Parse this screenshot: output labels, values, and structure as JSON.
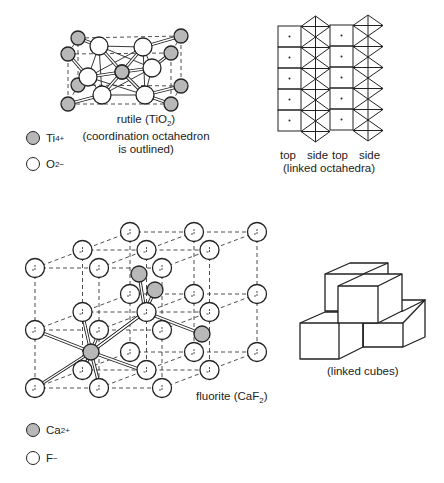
{
  "colors": {
    "cation": "#b8b8b8",
    "anion": "#ffffff",
    "stroke": "#222222"
  },
  "rutile": {
    "name": "rutile",
    "formula_base": "TiO",
    "formula_sub": "2",
    "caption_line2": "(coordination octahedron",
    "caption_line3": "is outlined)",
    "legend": [
      {
        "symbol": "Ti",
        "charge": "4+",
        "type": "cation"
      },
      {
        "symbol": "O",
        "charge": "2−",
        "type": "anion"
      }
    ]
  },
  "octahedra": {
    "column_labels": [
      "top",
      "side",
      "top",
      "side"
    ],
    "caption": "(linked octahedra)"
  },
  "fluorite": {
    "name": "fluorite",
    "formula_base": "CaF",
    "formula_sub": "2",
    "legend": [
      {
        "symbol": "Ca",
        "charge": "2+",
        "type": "cation"
      },
      {
        "symbol": "F",
        "charge": "−",
        "type": "anion"
      }
    ]
  },
  "cubes": {
    "caption": "(linked cubes)"
  }
}
